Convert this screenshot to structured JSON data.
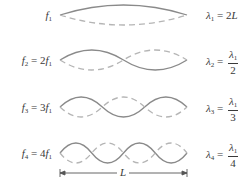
{
  "diagram": {
    "colors": {
      "solid_wave": "#8a8a8a",
      "dashed_wave": "#b5b5b5",
      "text": "#3a3a3a"
    },
    "rows": [
      {
        "n": 1,
        "freq_label": {
          "sym": "f",
          "sub": "1",
          "rhs": ""
        },
        "wavelength_label": {
          "sym": "λ",
          "sub": "1",
          "eq": "= 2",
          "rhs_sym": "L",
          "frac": null
        }
      },
      {
        "n": 2,
        "freq_label": {
          "sym": "f",
          "sub": "2",
          "rhs": "= 2",
          "rhs_sym": "f",
          "rhs_sub": "1"
        },
        "wavelength_label": {
          "sym": "λ",
          "sub": "2",
          "eq": "=",
          "frac": {
            "num_sym": "λ",
            "num_sub": "1",
            "den": "2"
          }
        }
      },
      {
        "n": 3,
        "freq_label": {
          "sym": "f",
          "sub": "3",
          "rhs": "= 3",
          "rhs_sym": "f",
          "rhs_sub": "1"
        },
        "wavelength_label": {
          "sym": "λ",
          "sub": "3",
          "eq": "=",
          "frac": {
            "num_sym": "λ",
            "num_sub": "1",
            "den": "3"
          }
        }
      },
      {
        "n": 4,
        "freq_label": {
          "sym": "f",
          "sub": "4",
          "rhs": "= 4",
          "rhs_sym": "f",
          "rhs_sub": "1"
        },
        "wavelength_label": {
          "sym": "λ",
          "sub": "4",
          "eq": "=",
          "frac": {
            "num_sym": "λ",
            "num_sub": "1",
            "den": "4"
          }
        }
      }
    ],
    "length_marker": {
      "label": "L"
    }
  }
}
